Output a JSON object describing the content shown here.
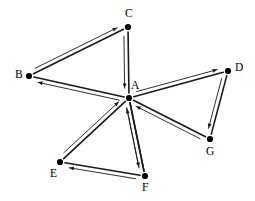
{
  "diagram": {
    "type": "directed-graph",
    "title": "",
    "width": 255,
    "height": 201,
    "background_color": "#ffffff",
    "edge_color": "#1a1a1a",
    "node_color": "#000000",
    "label_color": "#000000",
    "nodes": [
      {
        "id": "A",
        "label": "A",
        "x": 129,
        "y": 98,
        "label_x": 131,
        "label_y": 80
      },
      {
        "id": "B",
        "label": "B",
        "x": 29,
        "y": 76,
        "label_x": 15,
        "label_y": 69
      },
      {
        "id": "C",
        "label": "C",
        "x": 128,
        "y": 27,
        "label_x": 125,
        "label_y": 8
      },
      {
        "id": "D",
        "label": "D",
        "x": 228,
        "y": 71,
        "label_x": 235,
        "label_y": 62
      },
      {
        "id": "E",
        "label": "E",
        "x": 60,
        "y": 162,
        "label_x": 50,
        "label_y": 168
      },
      {
        "id": "F",
        "label": "F",
        "x": 145,
        "y": 176,
        "label_x": 142,
        "label_y": 182
      },
      {
        "id": "G",
        "label": "G",
        "x": 210,
        "y": 139,
        "label_x": 206,
        "label_y": 146
      }
    ],
    "edges": [
      {
        "id": "B-C",
        "from": "B",
        "to": "C",
        "direction": "B->C",
        "arrow_side": "left"
      },
      {
        "id": "C-A",
        "from": "C",
        "to": "A",
        "direction": "C->A",
        "arrow_side": "right"
      },
      {
        "id": "A-B",
        "from": "A",
        "to": "B",
        "direction": "A->B",
        "arrow_side": "left"
      },
      {
        "id": "A-D",
        "from": "A",
        "to": "D",
        "direction": "A->D",
        "arrow_side": "left"
      },
      {
        "id": "D-G",
        "from": "D",
        "to": "G",
        "direction": "D->G",
        "arrow_side": "right"
      },
      {
        "id": "G-A",
        "from": "G",
        "to": "A",
        "direction": "G->A",
        "arrow_side": "left"
      },
      {
        "id": "E-A",
        "from": "E",
        "to": "A",
        "direction": "E->A",
        "arrow_side": "left"
      },
      {
        "id": "A-F",
        "from": "A",
        "to": "F",
        "direction": "A->F",
        "arrow_side": "right"
      },
      {
        "id": "F-A",
        "from": "F",
        "to": "A",
        "direction": "F->A",
        "arrow_side": "left"
      },
      {
        "id": "F-E",
        "from": "F",
        "to": "E",
        "direction": "F->E",
        "arrow_side": "left"
      }
    ]
  }
}
